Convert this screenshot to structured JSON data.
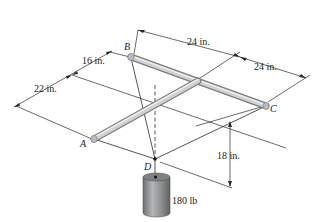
{
  "points": {
    "A": "A",
    "B": "B",
    "C": "C",
    "D": "D"
  },
  "dimensions": {
    "d1": "24 in.",
    "d2": "24 in.",
    "d3": "16 in.",
    "d4": "22 in.",
    "d5": "18 in."
  },
  "load": {
    "label": "180 lb"
  },
  "colors": {
    "rod": "#c8cacb",
    "rod_shadow": "#8d9091",
    "cylinder": "#8f9192",
    "line": "#2a2a2a"
  }
}
